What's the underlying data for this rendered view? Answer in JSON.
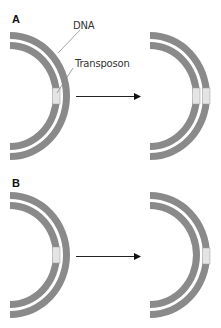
{
  "figure": {
    "panels": [
      {
        "label": "A",
        "callouts": {
          "dna": "DNA",
          "transposon": "Transposon"
        },
        "before": {
          "transposon_in": [
            "inner"
          ]
        },
        "after": {
          "transposon_in": [
            "inner",
            "outer"
          ]
        },
        "description": "Replicative transposition: transposon copied, appears in both strands after"
      },
      {
        "label": "B",
        "before": {
          "transposon_in": [
            "inner"
          ]
        },
        "after": {
          "transposon_in": [
            "outer"
          ]
        },
        "description": "Conservative transposition: transposon moves to a new location"
      }
    ],
    "colors": {
      "strand": "#8a8a8a",
      "transposon": "#e4e4e4",
      "transposon_border": "#9a9a9a",
      "arrow": "#222222",
      "leader_line": "#8a8a8a"
    }
  }
}
